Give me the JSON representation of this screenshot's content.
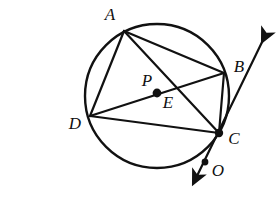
{
  "figure": {
    "kind": "euclidean-geometry-diagram",
    "width": 278,
    "height": 198,
    "stroke_color": "#111111",
    "background_color": "#ffffff"
  },
  "circle": {
    "name": "main-circle",
    "center_x": 157,
    "center_y": 96,
    "radius": 72,
    "stroke_width": 2.4
  },
  "points": [
    {
      "id": "A",
      "label": "A",
      "x": 124,
      "y": 31,
      "label_x": 110,
      "label_y": 16,
      "dot": false,
      "on_circle": true
    },
    {
      "id": "B",
      "label": "B",
      "x": 224,
      "y": 73,
      "label_x": 239,
      "label_y": 68,
      "dot": false,
      "on_circle": true
    },
    {
      "id": "C",
      "label": "C",
      "x": 219,
      "y": 133,
      "label_x": 234,
      "label_y": 140,
      "dot": true,
      "dot_radius": 4.2,
      "on_circle": true
    },
    {
      "id": "D",
      "label": "D",
      "x": 90,
      "y": 116,
      "label_x": 75,
      "label_y": 125,
      "dot": false,
      "on_circle": true
    },
    {
      "id": "P",
      "label": "P",
      "x": 157,
      "y": 93,
      "label_x": 147,
      "label_y": 82,
      "dot": true,
      "dot_radius": 4.4,
      "on_circle": false
    },
    {
      "id": "E",
      "label": "E",
      "x": 179,
      "y": 97,
      "label_x": 168,
      "label_y": 104,
      "dot": false,
      "on_circle": false
    },
    {
      "id": "O",
      "label": "O",
      "x": 205,
      "y": 162,
      "label_x": 218,
      "label_y": 172,
      "dot": true,
      "dot_radius": 3.4,
      "on_circle": false
    }
  ],
  "segments": [
    {
      "name": "chord-A-D",
      "from": "A",
      "to": "D"
    },
    {
      "name": "chord-A-B",
      "from": "A",
      "to": "B"
    },
    {
      "name": "chord-A-C",
      "from": "A",
      "to": "C"
    },
    {
      "name": "chord-D-B",
      "from": "D",
      "to": "B"
    },
    {
      "name": "chord-D-C",
      "from": "D",
      "to": "C"
    },
    {
      "name": "chord-B-C",
      "from": "B",
      "to": "C"
    }
  ],
  "ray": {
    "name": "tangent-ray-through-C",
    "through_point": "C",
    "arrow_up_x": 268,
    "arrow_up_y": 32,
    "arrow_down_x": 192,
    "arrow_down_y": 183,
    "double_headed": true
  },
  "labels_style": {
    "font_style": "italic",
    "font_size_px": 17
  }
}
